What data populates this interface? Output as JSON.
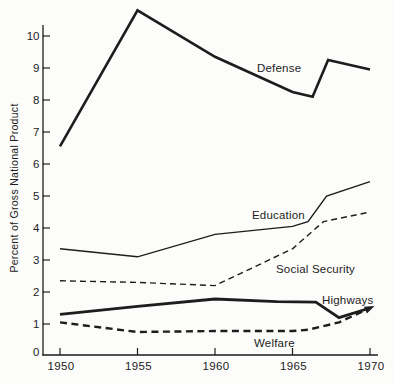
{
  "chart_data": {
    "type": "line",
    "title": "",
    "xlabel": "",
    "ylabel": "Percent of Gross National Product",
    "x_ticks": [
      "1950",
      "1955",
      "1960",
      "1965",
      "1970"
    ],
    "y_ticks": [
      0,
      1,
      2,
      3,
      4,
      5,
      6,
      7,
      8,
      9,
      10
    ],
    "xlim": [
      1950,
      1970
    ],
    "ylim": [
      0,
      11
    ],
    "grid": false,
    "legend": "inline-labels",
    "ink_color": "#1d1d1d",
    "paper_color": "#fcfcfa",
    "series": [
      {
        "name": "Defense",
        "line": "solid",
        "width": 2.6,
        "points": [
          [
            1950,
            6.55
          ],
          [
            1955,
            10.8
          ],
          [
            1960,
            9.35
          ],
          [
            1965,
            8.25
          ],
          [
            1966.3,
            8.1
          ],
          [
            1967.3,
            9.25
          ],
          [
            1970,
            8.95
          ]
        ],
        "label": {
          "text": "Defense",
          "x": 257,
          "y": 72
        }
      },
      {
        "name": "Education",
        "line": "solid",
        "width": 1.4,
        "points": [
          [
            1950,
            3.35
          ],
          [
            1955,
            3.1
          ],
          [
            1960,
            3.8
          ],
          [
            1965,
            4.05
          ],
          [
            1966,
            4.2
          ],
          [
            1967.2,
            5.0
          ],
          [
            1970,
            5.45
          ]
        ],
        "label": {
          "text": "Education",
          "x": 252,
          "y": 219
        }
      },
      {
        "name": "Social Security",
        "line": "dashed",
        "width": 1.4,
        "dash": "6,4",
        "points": [
          [
            1950,
            2.35
          ],
          [
            1955,
            2.3
          ],
          [
            1960,
            2.2
          ],
          [
            1965,
            3.35
          ],
          [
            1967,
            4.2
          ],
          [
            1970,
            4.5
          ]
        ],
        "label": {
          "text": "Social Security",
          "x": 276,
          "y": 273
        }
      },
      {
        "name": "Highways",
        "line": "solid",
        "width": 2.8,
        "points": [
          [
            1950,
            1.3
          ],
          [
            1955,
            1.55
          ],
          [
            1960,
            1.78
          ],
          [
            1964,
            1.7
          ],
          [
            1966.5,
            1.68
          ],
          [
            1968,
            1.2
          ],
          [
            1970,
            1.5
          ]
        ],
        "label": {
          "text": "Highways",
          "x": 322,
          "y": 304
        }
      },
      {
        "name": "Welfare",
        "line": "dashed",
        "width": 2.4,
        "dash": "7,4.5",
        "arrow_end": true,
        "points": [
          [
            1950,
            1.05
          ],
          [
            1955,
            0.75
          ],
          [
            1960,
            0.78
          ],
          [
            1965,
            0.78
          ],
          [
            1966,
            0.82
          ],
          [
            1968,
            1.05
          ],
          [
            1970,
            1.5
          ]
        ],
        "label": {
          "text": "Welfare",
          "x": 254,
          "y": 347
        }
      }
    ]
  }
}
